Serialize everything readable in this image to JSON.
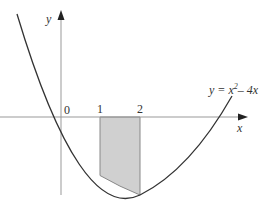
{
  "diagram": {
    "axes": {
      "x_label": "x",
      "y_label": "y",
      "origin_label": "0"
    },
    "ticks": [
      {
        "value": 1,
        "label": "1"
      },
      {
        "value": 2,
        "label": "2"
      }
    ],
    "curve": {
      "equation_lhs": "y = x",
      "equation_exp": "2",
      "equation_rhs": "– 4x",
      "function": "y = x^2 - 4x"
    },
    "shaded_region": {
      "from": 1,
      "to": 2,
      "color": "#d0d0d0"
    },
    "colors": {
      "curve": "#333333",
      "axes": "#aaaaaa",
      "shade": "#d0d0d0"
    }
  }
}
